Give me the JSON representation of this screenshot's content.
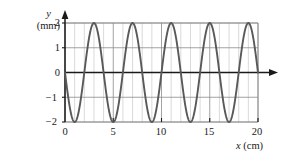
{
  "figure": {
    "name": "transverse-wave-snapshot",
    "background": "#ffffff"
  },
  "axes": {
    "y_var": "y",
    "y_unit": "(mm)",
    "x_label_var": "x",
    "x_label_unit": "(cm)",
    "x_ticks": [
      "0",
      "5",
      "10",
      "15",
      "20"
    ],
    "y_ticks": [
      "2",
      "1",
      "0",
      "−1",
      "−2"
    ]
  },
  "colors": {
    "curve": "#595959",
    "axis": "#1a1a1a",
    "grid_minor": "#bfbfbf",
    "grid_major": "#8c8c8c",
    "text": "#1a1a1a"
  },
  "chart_data": {
    "type": "line",
    "title": "",
    "xlabel": "x (cm)",
    "ylabel": "y (mm)",
    "xlim": [
      0,
      20
    ],
    "ylim": [
      -2,
      2
    ],
    "grid": true,
    "legend": "none",
    "x_ticks": [
      0,
      5,
      10,
      15,
      20
    ],
    "y_ticks": [
      -2,
      -1,
      0,
      1,
      2
    ],
    "x_gridline_spacing": 1,
    "y_gridline_spacing": 1,
    "series": [
      {
        "name": "y = -2 sin(πx/2)",
        "amplitude_mm": 2,
        "wavelength_cm": 4,
        "phase": "starts at y = 0 descending",
        "peaks_x_cm": [
          3,
          7,
          11,
          15,
          19
        ],
        "troughs_x_cm": [
          1,
          5,
          9,
          13,
          17
        ],
        "zero_crossings_x_cm": [
          0,
          2,
          4,
          6,
          8,
          10,
          12,
          14,
          16,
          18,
          20
        ],
        "x": [
          0,
          0.25,
          0.5,
          0.75,
          1,
          1.25,
          1.5,
          1.75,
          2,
          2.25,
          2.5,
          2.75,
          3,
          3.25,
          3.5,
          3.75,
          4,
          4.25,
          4.5,
          4.75,
          5,
          5.25,
          5.5,
          5.75,
          6,
          6.25,
          6.5,
          6.75,
          7,
          7.25,
          7.5,
          7.75,
          8,
          8.25,
          8.5,
          8.75,
          9,
          9.25,
          9.5,
          9.75,
          10,
          10.25,
          10.5,
          10.75,
          11,
          11.25,
          11.5,
          11.75,
          12,
          12.25,
          12.5,
          12.75,
          13,
          13.25,
          13.5,
          13.75,
          14,
          14.25,
          14.5,
          14.75,
          15,
          15.25,
          15.5,
          15.75,
          16,
          16.25,
          16.5,
          16.75,
          17,
          17.25,
          17.5,
          17.75,
          18,
          18.25,
          18.5,
          18.75,
          19,
          19.25,
          19.5,
          19.75,
          20
        ],
        "y": [
          0,
          -0.77,
          -1.41,
          -1.85,
          -2,
          -1.85,
          -1.41,
          -0.77,
          0,
          0.77,
          1.41,
          1.85,
          2,
          1.85,
          1.41,
          0.77,
          0,
          -0.77,
          -1.41,
          -1.85,
          -2,
          -1.85,
          -1.41,
          -0.77,
          0,
          0.77,
          1.41,
          1.85,
          2,
          1.85,
          1.41,
          0.77,
          0,
          -0.77,
          -1.41,
          -1.85,
          -2,
          -1.85,
          -1.41,
          -0.77,
          0,
          0.77,
          1.41,
          1.85,
          2,
          1.85,
          1.41,
          0.77,
          0,
          -0.77,
          -1.41,
          -1.85,
          -2,
          -1.85,
          -1.41,
          -0.77,
          0,
          0.77,
          1.41,
          1.85,
          2,
          1.85,
          1.41,
          0.77,
          0,
          -0.77,
          -1.41,
          -1.85,
          -2,
          -1.85,
          -1.41,
          -0.77,
          0,
          0.77,
          1.41,
          1.85,
          2,
          1.85,
          1.41,
          0.77,
          0
        ]
      }
    ]
  }
}
